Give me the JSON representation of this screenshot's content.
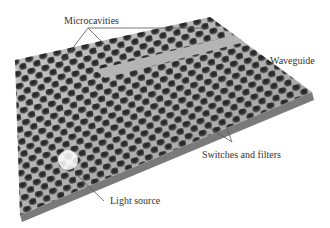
{
  "diagram": {
    "labels": {
      "microcavities": "Microcavities",
      "waveguide": "Waveguide",
      "switches": "Switches and filters",
      "light_source": "Light source"
    },
    "colors": {
      "slab": "#b8b8b8",
      "hole": "#3a3a3a",
      "leader": "#555555",
      "text": "#333333"
    }
  }
}
